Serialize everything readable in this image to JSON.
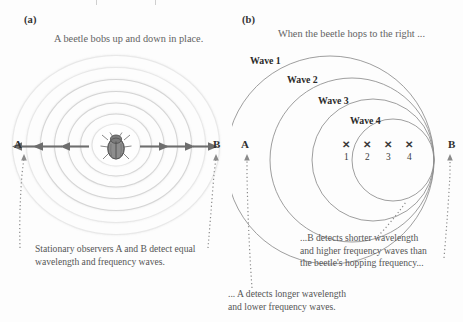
{
  "figure": {
    "background_color": "#fdfdfd",
    "ink_color": "#3a3a3a"
  },
  "panel_a": {
    "label": "(a)",
    "header": "A beetle bobs up and down in place.",
    "observer_left": "A",
    "observer_right": "B",
    "caption_line1": "Stationary observers A and B detect equal",
    "caption_line2": "wavelength and frequency waves.",
    "arrow_count_left": 3,
    "arrow_count_right": 3,
    "ripple_count": 7,
    "source_icon": "beetle-icon"
  },
  "panel_b": {
    "label": "(b)",
    "header": "When the beetle hops to the right ...",
    "observer_left": "A",
    "observer_right": "B",
    "wave_labels": [
      "Wave 1",
      "Wave 2",
      "Wave 3",
      "Wave 4"
    ],
    "positions": [
      {
        "marker": "✕",
        "number": "1"
      },
      {
        "marker": "✕",
        "number": "2"
      },
      {
        "marker": "✕",
        "number": "3"
      },
      {
        "marker": "✕",
        "number": "4"
      }
    ],
    "caption_right_line1": "...B detects shorter wavelength",
    "caption_right_line2": "and higher frequency waves than",
    "caption_right_line3": "the beetle's hopping frequency...",
    "caption_left_line1": "... A detects longer wavelength",
    "caption_left_line2": "and lower frequency waves."
  }
}
